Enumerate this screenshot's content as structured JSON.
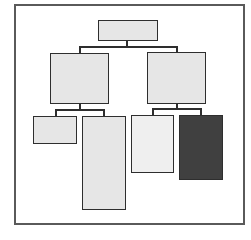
{
  "diagram": {
    "type": "tree",
    "frame": {
      "x": 14,
      "y": 4,
      "w": 231,
      "h": 221,
      "border": "#5a5a5a"
    },
    "colors": {
      "light_fill": "#e6e6e6",
      "lighter_fill": "#efefef",
      "dark_fill": "#404040",
      "stroke": "#2e2e2e"
    },
    "nodes": [
      {
        "id": "root",
        "x": 98,
        "y": 20,
        "w": 60,
        "h": 21,
        "fill": "#e6e6e6"
      },
      {
        "id": "left-child",
        "x": 50,
        "y": 53,
        "w": 59,
        "h": 51,
        "fill": "#e6e6e6"
      },
      {
        "id": "right-child",
        "x": 147,
        "y": 52,
        "w": 59,
        "h": 52,
        "fill": "#e6e6e6"
      },
      {
        "id": "leaf-1",
        "x": 33,
        "y": 116,
        "w": 44,
        "h": 28,
        "fill": "#e6e6e6"
      },
      {
        "id": "leaf-2",
        "x": 82,
        "y": 116,
        "w": 44,
        "h": 94,
        "fill": "#e6e6e6"
      },
      {
        "id": "leaf-3",
        "x": 131,
        "y": 115,
        "w": 43,
        "h": 58,
        "fill": "#efefef"
      },
      {
        "id": "leaf-4",
        "x": 179,
        "y": 115,
        "w": 44,
        "h": 65,
        "fill": "#404040"
      }
    ],
    "edges": [
      {
        "from": "root",
        "to": [
          "left-child",
          "right-child"
        ]
      },
      {
        "from": "left-child",
        "to": [
          "leaf-1",
          "leaf-2"
        ]
      },
      {
        "from": "right-child",
        "to": [
          "leaf-3",
          "leaf-4"
        ]
      }
    ]
  }
}
